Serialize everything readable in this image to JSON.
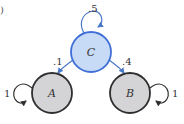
{
  "diagram": {
    "type": "markov-chain",
    "corner_mark": ")",
    "colors": {
      "absorbing_fill": "#d4d4d6",
      "absorbing_stroke": "#2f2f2f",
      "transient_fill": "#c8dbf6",
      "transient_stroke": "#3f6fd6",
      "edge_blue": "#4a78c8",
      "edge_dark": "#2f2f2f"
    },
    "nodes": [
      {
        "id": "C",
        "label": "C",
        "kind": "transient"
      },
      {
        "id": "A",
        "label": "A",
        "kind": "absorbing"
      },
      {
        "id": "B",
        "label": "B",
        "kind": "absorbing"
      }
    ],
    "edges": [
      {
        "from": "C",
        "to": "C",
        "label": ".5"
      },
      {
        "from": "C",
        "to": "A",
        "label": ".1"
      },
      {
        "from": "C",
        "to": "B",
        "label": ".4"
      },
      {
        "from": "A",
        "to": "A",
        "label": "1"
      },
      {
        "from": "B",
        "to": "B",
        "label": "1"
      }
    ]
  }
}
